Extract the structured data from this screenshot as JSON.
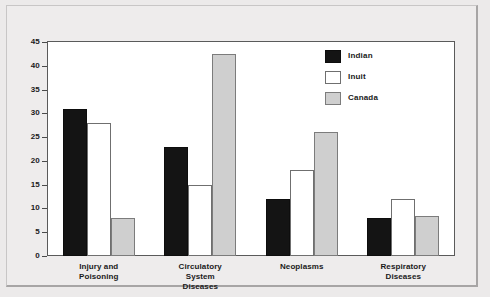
{
  "chart_data": {
    "type": "bar",
    "title": "",
    "xlabel": "",
    "ylabel": "",
    "ylim": [
      0,
      45
    ],
    "yticks": [
      0,
      5,
      10,
      15,
      20,
      25,
      30,
      35,
      40,
      45
    ],
    "ytick_labels": [
      "0",
      "5",
      "10",
      "15",
      "20",
      "25",
      "30",
      "35",
      "40",
      "45"
    ],
    "grid": false,
    "legend_position": "top-right",
    "categories": [
      "Injury and Poisoning",
      "Circulatory System Diseases",
      "Neoplasms",
      "Respiratory Diseases"
    ],
    "category_label_lines": [
      [
        "Injury and",
        "Poisoning"
      ],
      [
        "Circulatory",
        "System",
        "Diseases"
      ],
      [
        "Neoplasms"
      ],
      [
        "Respiratory",
        "Diseases"
      ]
    ],
    "series": [
      {
        "name": "Indian",
        "color": "#141414",
        "values": [
          31,
          23,
          12,
          8
        ]
      },
      {
        "name": "Inuit",
        "color": "#ffffff",
        "values": [
          28,
          15,
          18,
          12
        ]
      },
      {
        "name": "Canada",
        "color": "#cfcfcf",
        "values": [
          8,
          42.5,
          26,
          8.5
        ]
      }
    ]
  },
  "legend": {
    "items": [
      {
        "label": "Indian",
        "swatch": "black-swatch"
      },
      {
        "label": "Inuit",
        "swatch": "white-swatch"
      },
      {
        "label": "Canada",
        "swatch": "gray-swatch"
      }
    ]
  }
}
